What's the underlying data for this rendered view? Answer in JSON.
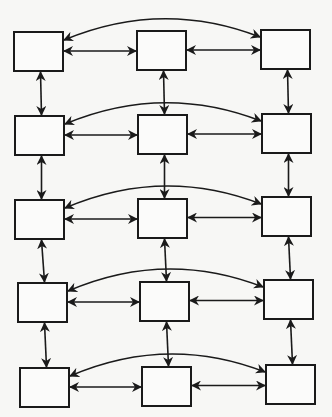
{
  "diagram": {
    "type": "grid-network",
    "rows": 5,
    "cols": 3,
    "nodes": [
      {
        "id": "r1c1",
        "row": 1,
        "col": 1,
        "label": ""
      },
      {
        "id": "r1c2",
        "row": 1,
        "col": 2,
        "label": ""
      },
      {
        "id": "r1c3",
        "row": 1,
        "col": 3,
        "label": ""
      },
      {
        "id": "r2c1",
        "row": 2,
        "col": 1,
        "label": ""
      },
      {
        "id": "r2c2",
        "row": 2,
        "col": 2,
        "label": ""
      },
      {
        "id": "r2c3",
        "row": 2,
        "col": 3,
        "label": ""
      },
      {
        "id": "r3c1",
        "row": 3,
        "col": 1,
        "label": ""
      },
      {
        "id": "r3c2",
        "row": 3,
        "col": 2,
        "label": ""
      },
      {
        "id": "r3c3",
        "row": 3,
        "col": 3,
        "label": ""
      },
      {
        "id": "r4c1",
        "row": 4,
        "col": 1,
        "label": ""
      },
      {
        "id": "r4c2",
        "row": 4,
        "col": 2,
        "label": ""
      },
      {
        "id": "r4c3",
        "row": 4,
        "col": 3,
        "label": ""
      },
      {
        "id": "r5c1",
        "row": 5,
        "col": 1,
        "label": ""
      },
      {
        "id": "r5c2",
        "row": 5,
        "col": 2,
        "label": ""
      },
      {
        "id": "r5c3",
        "row": 5,
        "col": 3,
        "label": ""
      }
    ],
    "edges": [
      {
        "from": "r1c1",
        "to": "r1c2",
        "kind": "straight",
        "direction": "both"
      },
      {
        "from": "r1c2",
        "to": "r1c3",
        "kind": "straight",
        "direction": "both"
      },
      {
        "from": "r1c1",
        "to": "r1c3",
        "kind": "arc",
        "direction": "both"
      },
      {
        "from": "r2c1",
        "to": "r2c2",
        "kind": "straight",
        "direction": "both"
      },
      {
        "from": "r2c2",
        "to": "r2c3",
        "kind": "straight",
        "direction": "both"
      },
      {
        "from": "r2c1",
        "to": "r2c3",
        "kind": "arc",
        "direction": "both"
      },
      {
        "from": "r3c1",
        "to": "r3c2",
        "kind": "straight",
        "direction": "both"
      },
      {
        "from": "r3c2",
        "to": "r3c3",
        "kind": "straight",
        "direction": "both"
      },
      {
        "from": "r3c1",
        "to": "r3c3",
        "kind": "arc",
        "direction": "both"
      },
      {
        "from": "r4c1",
        "to": "r4c2",
        "kind": "straight",
        "direction": "both"
      },
      {
        "from": "r4c2",
        "to": "r4c3",
        "kind": "straight",
        "direction": "both"
      },
      {
        "from": "r4c1",
        "to": "r4c3",
        "kind": "arc",
        "direction": "both"
      },
      {
        "from": "r5c1",
        "to": "r5c2",
        "kind": "straight",
        "direction": "both"
      },
      {
        "from": "r5c2",
        "to": "r5c3",
        "kind": "straight",
        "direction": "both"
      },
      {
        "from": "r5c1",
        "to": "r5c3",
        "kind": "arc",
        "direction": "both"
      },
      {
        "from": "r1c1",
        "to": "r2c1",
        "kind": "straight",
        "direction": "both"
      },
      {
        "from": "r2c1",
        "to": "r3c1",
        "kind": "straight",
        "direction": "both"
      },
      {
        "from": "r3c1",
        "to": "r4c1",
        "kind": "straight",
        "direction": "both"
      },
      {
        "from": "r4c1",
        "to": "r5c1",
        "kind": "straight",
        "direction": "both"
      },
      {
        "from": "r1c2",
        "to": "r2c2",
        "kind": "straight",
        "direction": "both"
      },
      {
        "from": "r2c2",
        "to": "r3c2",
        "kind": "straight",
        "direction": "both"
      },
      {
        "from": "r3c2",
        "to": "r4c2",
        "kind": "straight",
        "direction": "both"
      },
      {
        "from": "r4c2",
        "to": "r5c2",
        "kind": "straight",
        "direction": "both"
      },
      {
        "from": "r1c3",
        "to": "r2c3",
        "kind": "straight",
        "direction": "both"
      },
      {
        "from": "r2c3",
        "to": "r3c3",
        "kind": "straight",
        "direction": "both"
      },
      {
        "from": "r3c3",
        "to": "r4c3",
        "kind": "straight",
        "direction": "both"
      },
      {
        "from": "r4c3",
        "to": "r5c3",
        "kind": "straight",
        "direction": "both"
      }
    ],
    "colors": {
      "stroke": "#1a1a1a",
      "node_fill": "#fbfbfa",
      "background": "#f7f7f5"
    }
  }
}
